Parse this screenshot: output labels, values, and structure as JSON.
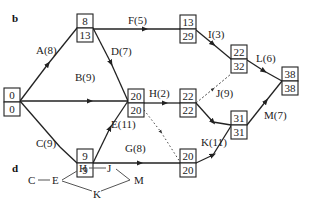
{
  "panels": {
    "b": "b",
    "d": "d"
  },
  "network": {
    "nodes": [
      {
        "id": "n1",
        "early": "0",
        "late": "0"
      },
      {
        "id": "n2",
        "early": "8",
        "late": "13"
      },
      {
        "id": "n3",
        "early": "9",
        "late": "9"
      },
      {
        "id": "n4",
        "early": "20",
        "late": "20"
      },
      {
        "id": "n5",
        "early": "13",
        "late": "29"
      },
      {
        "id": "n6",
        "early": "22",
        "late": "22"
      },
      {
        "id": "n7",
        "early": "20",
        "late": "20"
      },
      {
        "id": "n8",
        "early": "22",
        "late": "32"
      },
      {
        "id": "n9",
        "early": "31",
        "late": "31"
      },
      {
        "id": "n10",
        "early": "38",
        "late": "38"
      }
    ],
    "activities": [
      {
        "label": "A(8)",
        "from": "n1",
        "to": "n2"
      },
      {
        "label": "B(9)",
        "from": "n1",
        "to": "n4"
      },
      {
        "label": "C(9)",
        "from": "n1",
        "to": "n3"
      },
      {
        "label": "D(7)",
        "from": "n2",
        "to": "n4"
      },
      {
        "label": "E(11)",
        "from": "n3",
        "to": "n4"
      },
      {
        "label": "F(5)",
        "from": "n2",
        "to": "n5"
      },
      {
        "label": "G(8)",
        "from": "n3",
        "to": "n7"
      },
      {
        "label": "H(2)",
        "from": "n4",
        "to": "n6"
      },
      {
        "label": "I(3)",
        "from": "n5",
        "to": "n8"
      },
      {
        "label": "J(9)",
        "from": "n6",
        "to": "n9"
      },
      {
        "label": "K(11)",
        "from": "n7",
        "to": "n9"
      },
      {
        "label": "L(6)",
        "from": "n8",
        "to": "n10"
      },
      {
        "label": "M(7)",
        "from": "n9",
        "to": "n10"
      }
    ],
    "dummies": [
      {
        "from": "n6",
        "to": "n8",
        "style": "dashed"
      },
      {
        "from": "n4",
        "to": "n7",
        "style": "dotted"
      }
    ]
  },
  "critical_path_graph": {
    "nodes": [
      "C",
      "E",
      "H",
      "J",
      "K",
      "M"
    ]
  }
}
